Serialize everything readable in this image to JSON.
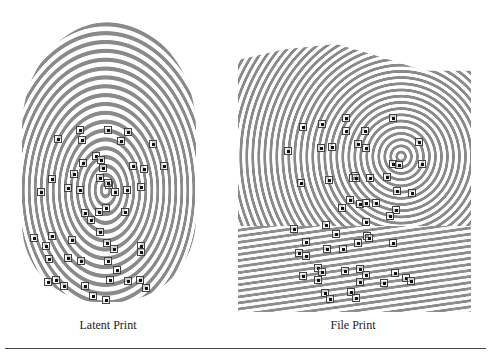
{
  "figure": {
    "latent": {
      "caption": "Latent Print",
      "minutiae": [
        [
          80,
          130
        ],
        [
          108,
          130
        ],
        [
          128,
          132
        ],
        [
          58,
          139
        ],
        [
          82,
          140
        ],
        [
          121,
          141
        ],
        [
          153,
          144
        ],
        [
          52,
          179
        ],
        [
          74,
          174
        ],
        [
          83,
          163
        ],
        [
          96,
          156
        ],
        [
          101,
          160
        ],
        [
          103,
          168
        ],
        [
          133,
          166
        ],
        [
          144,
          169
        ],
        [
          164,
          166
        ],
        [
          100,
          178
        ],
        [
          68,
          188
        ],
        [
          80,
          190
        ],
        [
          109,
          185
        ],
        [
          115,
          192
        ],
        [
          127,
          190
        ],
        [
          141,
          187
        ],
        [
          41,
          192
        ],
        [
          108,
          183
        ],
        [
          99,
          212
        ],
        [
          85,
          213
        ],
        [
          91,
          220
        ],
        [
          106,
          208
        ],
        [
          125,
          212
        ],
        [
          52,
          236
        ],
        [
          34,
          238
        ],
        [
          46,
          246
        ],
        [
          72,
          240
        ],
        [
          100,
          232
        ],
        [
          107,
          243
        ],
        [
          114,
          249
        ],
        [
          141,
          246
        ],
        [
          49,
          259
        ],
        [
          68,
          258
        ],
        [
          81,
          261
        ],
        [
          108,
          261
        ],
        [
          141,
          252
        ],
        [
          48,
          282
        ],
        [
          64,
          286
        ],
        [
          85,
          286
        ],
        [
          93,
          296
        ],
        [
          106,
          300
        ],
        [
          110,
          280
        ],
        [
          128,
          281
        ],
        [
          140,
          280
        ],
        [
          146,
          288
        ],
        [
          56,
          280
        ],
        [
          117,
          270
        ]
      ]
    },
    "file": {
      "caption": "File Print",
      "minutiae": [
        [
          322,
          124
        ],
        [
          346,
          118
        ],
        [
          393,
          118
        ],
        [
          303,
          127
        ],
        [
          365,
          131
        ],
        [
          346,
          131
        ],
        [
          419,
          142
        ],
        [
          321,
          148
        ],
        [
          332,
          147
        ],
        [
          358,
          144
        ],
        [
          366,
          148
        ],
        [
          288,
          151
        ],
        [
          393,
          164
        ],
        [
          399,
          165
        ],
        [
          422,
          164
        ],
        [
          355,
          176
        ],
        [
          387,
          177
        ],
        [
          301,
          183
        ],
        [
          329,
          180
        ],
        [
          353,
          178
        ],
        [
          356,
          178
        ],
        [
          370,
          178
        ],
        [
          397,
          191
        ],
        [
          412,
          193
        ],
        [
          350,
          200
        ],
        [
          360,
          204
        ],
        [
          366,
          203
        ],
        [
          376,
          203
        ],
        [
          342,
          208
        ],
        [
          396,
          210
        ],
        [
          294,
          229
        ],
        [
          326,
          225
        ],
        [
          366,
          222
        ],
        [
          367,
          236
        ],
        [
          336,
          234
        ],
        [
          306,
          242
        ],
        [
          327,
          249
        ],
        [
          343,
          249
        ],
        [
          358,
          243
        ],
        [
          369,
          238
        ],
        [
          393,
          243
        ],
        [
          390,
          216
        ],
        [
          299,
          253
        ],
        [
          306,
          256
        ],
        [
          318,
          268
        ],
        [
          345,
          271
        ],
        [
          360,
          269
        ],
        [
          384,
          283
        ],
        [
          406,
          278
        ],
        [
          411,
          281
        ],
        [
          325,
          293
        ],
        [
          330,
          299
        ],
        [
          360,
          282
        ],
        [
          303,
          276
        ],
        [
          318,
          280
        ],
        [
          351,
          292
        ],
        [
          356,
          298
        ],
        [
          322,
          272
        ],
        [
          366,
          275
        ],
        [
          395,
          273
        ]
      ]
    }
  }
}
